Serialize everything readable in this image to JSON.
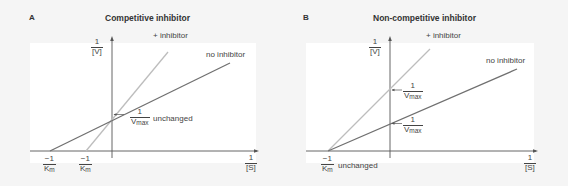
{
  "panels": [
    {
      "letter": "A",
      "title": "Competitive inhibitor",
      "y_axis_label": {
        "num": "1",
        "den": "[V]"
      },
      "x_axis_label": {
        "num": "1",
        "den": "[S]"
      },
      "series": [
        {
          "name": "+ inhibitor",
          "color": "#bdbdbd"
        },
        {
          "name": "no inhibitor",
          "color": "#707070"
        }
      ],
      "annotations": {
        "y_intercept": {
          "num": "1",
          "den_main": "V",
          "den_sub": "max",
          "note": "unchanged"
        },
        "x_intercept_no_inhibitor": {
          "num": "−1",
          "den_main": "K",
          "den_sub": "m"
        },
        "x_intercept_inhibitor": {
          "num": "−1",
          "den_main": "K",
          "den_sub": "m"
        }
      }
    },
    {
      "letter": "B",
      "title": "Non-competitive inhibitor",
      "y_axis_label": {
        "num": "1",
        "den": "[V]"
      },
      "x_axis_label": {
        "num": "1",
        "den": "[S]"
      },
      "series": [
        {
          "name": "+ inhibitor",
          "color": "#bdbdbd"
        },
        {
          "name": "no inhibitor",
          "color": "#707070"
        }
      ],
      "annotations": {
        "y_intercept_inhibitor": {
          "num": "1",
          "den_main": "V",
          "den_sub": "max"
        },
        "y_intercept_no_inhibitor": {
          "num": "1",
          "den_main": "V",
          "den_sub": "max"
        },
        "x_intercept": {
          "num": "−1",
          "den_main": "K",
          "den_sub": "m",
          "note": "unchanged"
        }
      }
    }
  ],
  "colors": {
    "axis": "#555555",
    "inhibitor_line": "#bdbdbd",
    "no_inhibitor_line": "#707070",
    "plot_bg": "#ffffff",
    "panel_bg": "#f5f5f5"
  }
}
